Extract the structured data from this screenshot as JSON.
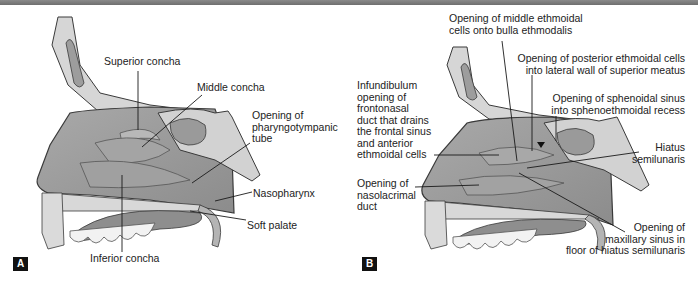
{
  "figure": {
    "panels": [
      {
        "id": "A",
        "badge": "A",
        "labels": {
          "superior_concha": "Superior concha",
          "middle_concha": "Middle concha",
          "pharyngotympanic": "Opening of\npharyngotympanic\ntube",
          "nasopharynx": "Nasopharynx",
          "soft_palate": "Soft palate",
          "inferior_concha": "Inferior concha"
        }
      },
      {
        "id": "B",
        "badge": "B",
        "labels": {
          "middle_ethmoidal": "Opening of middle ethmoidal\ncells onto bulla ethmodalis",
          "posterior_ethmoidal": "Opening of posterior ethmoidal cells\ninto lateral wall of superior meatus",
          "sphenoidal_sinus": "Opening of sphenoidal sinus\ninto sphenoethmoidal recess",
          "infundibulum": "Infundibulum\nopening of\nfrontonasal\nduct that drains\nthe frontal sinus\nand anterior\nethmoidal cells",
          "hiatus": "Hiatus\nsemilunaris",
          "nasolacrimal": "Opening of\nnasolacrimal\nduct",
          "maxillary": "Opening of\nmaxillary sinus in\nfloor of hiatus semilunaris"
        }
      }
    ],
    "colors": {
      "cavity": "#9a9a9a",
      "bone": "#d6d6d6",
      "outline": "#3a3a3a",
      "badge_bg": "#111111",
      "topbar": "#7a7a7a"
    }
  }
}
